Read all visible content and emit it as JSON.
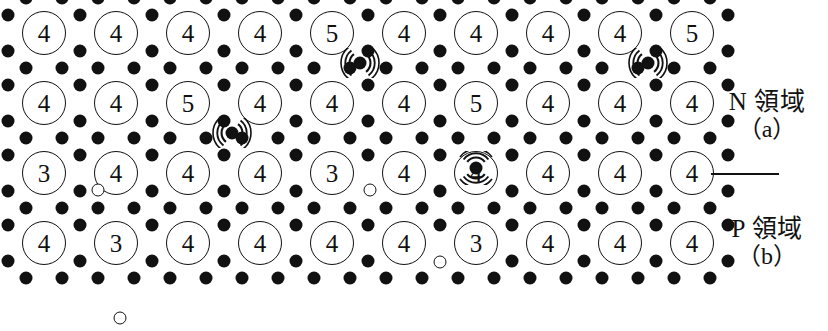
{
  "diagram": {
    "geometry": {
      "cell_w": 72,
      "cell_h": 70,
      "origin_x": 44,
      "origin_y": 33,
      "dot_r": 6.5,
      "atom_r": 22
    },
    "colors": {
      "ink": "#111111",
      "paper": "#ffffff"
    },
    "rows": [
      {
        "region": "N",
        "atoms": [
          "4",
          "4",
          "4",
          "4",
          "5",
          "4",
          "4",
          "4",
          "4",
          "5"
        ]
      },
      {
        "region": "N",
        "atoms": [
          "4",
          "4",
          "5",
          "4",
          "4",
          "4",
          "5",
          "4",
          "4",
          "4"
        ]
      },
      {
        "region": "P",
        "atoms": [
          "3",
          "4",
          "4",
          "4",
          "3",
          "4",
          "4",
          "4",
          "4",
          "4"
        ]
      },
      {
        "region": "P",
        "atoms": [
          "4",
          "3",
          "4",
          "4",
          "4",
          "4",
          "3",
          "4",
          "4",
          "4"
        ]
      }
    ],
    "free_electrons": [
      {
        "note": "row1-between-col5-col6",
        "x": 360,
        "y": 65,
        "dir": "side"
      },
      {
        "note": "row1-between-col9-col10",
        "x": 648,
        "y": 65,
        "dir": "side"
      },
      {
        "note": "row2-between-col3-col4",
        "x": 232,
        "y": 135,
        "dir": "side"
      },
      {
        "note": "row2-below-col7",
        "x": 476,
        "y": 170,
        "dir": "down"
      }
    ],
    "holes": [
      {
        "note": "row3-col1-right",
        "x": 98,
        "y": 190
      },
      {
        "note": "row3-col5-right",
        "x": 370,
        "y": 190
      },
      {
        "note": "row4-col2-below",
        "x": 120,
        "y": 318
      },
      {
        "note": "row4-col6-right",
        "x": 440,
        "y": 262
      }
    ],
    "labels": {
      "n_region": "N 領域",
      "n_sub": "（a）",
      "p_region": "P 領域",
      "p_sub": "（b）"
    }
  }
}
